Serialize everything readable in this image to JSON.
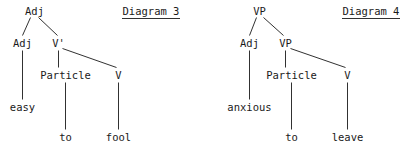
{
  "figure": {
    "diagrams": [
      {
        "caption": "Diagram 3",
        "caption_underlined": true,
        "nodes": {
          "root": "Adj",
          "left_child": "Adj",
          "right_child": "V'",
          "particle": "Particle",
          "verb": "V"
        },
        "leaves": {
          "adjective_word": "easy",
          "particle_word": "to",
          "verb_word": "fool"
        }
      },
      {
        "caption": "Diagram 4",
        "caption_underlined": true,
        "nodes": {
          "root": "VP",
          "left_child": "Adj",
          "right_child": "VP",
          "particle": "Particle",
          "verb": "V"
        },
        "leaves": {
          "adjective_word": "anxious",
          "particle_word": "to",
          "verb_word": "leave"
        }
      }
    ],
    "colors": {
      "ink": "#1a1a1a",
      "background": "#ffffff"
    }
  }
}
